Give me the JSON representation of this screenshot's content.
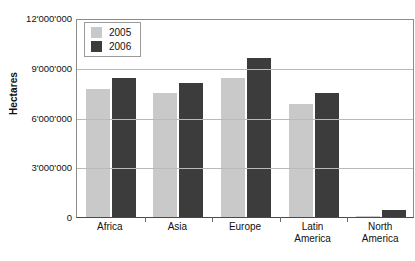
{
  "chart_data": {
    "type": "bar",
    "title": "",
    "xlabel": "",
    "ylabel": "Hectares",
    "categories": [
      "Africa",
      "Asia",
      "Europe",
      "Latin America",
      "North America"
    ],
    "category_lines": [
      [
        "Africa"
      ],
      [
        "Asia"
      ],
      [
        "Europe"
      ],
      [
        "Latin",
        "America"
      ],
      [
        "North",
        "America"
      ]
    ],
    "series": [
      {
        "name": "2005",
        "color": "#c9c9c9",
        "values": [
          7700000,
          7500000,
          8400000,
          6800000,
          50000
        ]
      },
      {
        "name": "2006",
        "color": "#3c3c3c",
        "values": [
          8400000,
          8100000,
          9600000,
          7500000,
          400000
        ]
      }
    ],
    "ylim": [
      0,
      12000000
    ],
    "yticks": [
      0,
      3000000,
      6000000,
      9000000,
      12000000
    ],
    "ytick_labels": [
      "0",
      "3'000'000",
      "6'000'000",
      "9'000'000",
      "12'000'000"
    ],
    "grid": true,
    "legend_position": "top-left"
  },
  "legend": {
    "items": [
      {
        "label": "2005"
      },
      {
        "label": "2006"
      }
    ]
  },
  "colors": {
    "series_2005": "#c9c9c9",
    "series_2006": "#3c3c3c",
    "gridline": "#b9b9b9",
    "axis": "#4a4a4a",
    "background": "#ffffff",
    "text": "#111111"
  }
}
